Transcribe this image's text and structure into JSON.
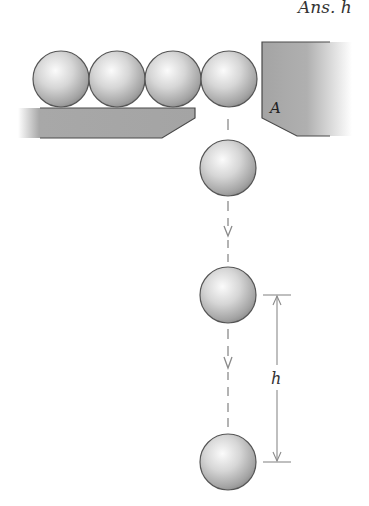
{
  "header": {
    "answer_label": "Ans. h"
  },
  "labels": {
    "block": "A",
    "height": "h"
  },
  "colors": {
    "block_fill": "#a8a8a8",
    "block_edge": "#4a4a4a",
    "ball_light": "#f6f6f6",
    "ball_mid": "#c4c4c4",
    "ball_dark": "#8c8c8c",
    "ball_edge": "#555555",
    "dim_line": "#8a8a8a"
  },
  "scene": {
    "balls_on_shelf": 4,
    "falling_balls": 3,
    "description": "Row of balls on a shelf; last ball drops past block A, falling positions shown with dashed path and height dimension h"
  }
}
